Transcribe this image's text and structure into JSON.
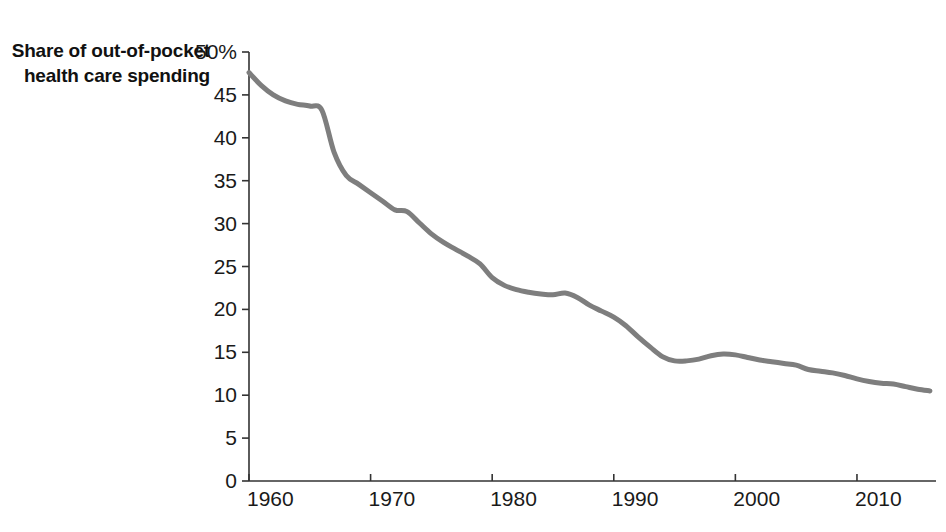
{
  "chart_data": {
    "type": "line",
    "title": "Share of out-of-pocket health care spending",
    "xlabel": "",
    "ylabel": "",
    "xlim": [
      1960,
      2016.5
    ],
    "ylim": [
      0,
      50
    ],
    "grid": false,
    "legend": null,
    "series_color": "#7e7e7e",
    "axis_color": "#333333",
    "x_tick_labels": [
      "1960",
      "1970",
      "1980",
      "1990",
      "2000",
      "2010"
    ],
    "x_ticks": [
      1960,
      1970,
      1980,
      1990,
      2000,
      2010
    ],
    "y_tick_labels": [
      "0",
      "5",
      "10",
      "15",
      "20",
      "25",
      "30",
      "35",
      "40",
      "45",
      "50%"
    ],
    "y_ticks": [
      0,
      5,
      10,
      15,
      20,
      25,
      30,
      35,
      40,
      45,
      50
    ],
    "series": [
      {
        "name": "Share of out-of-pocket health care spending",
        "x": [
          1960,
          1961,
          1962,
          1963,
          1964,
          1965,
          1966,
          1967,
          1968,
          1969,
          1970,
          1971,
          1972,
          1973,
          1974,
          1975,
          1976,
          1977,
          1978,
          1979,
          1980,
          1981,
          1982,
          1983,
          1984,
          1985,
          1986,
          1987,
          1988,
          1989,
          1990,
          1991,
          1992,
          1993,
          1994,
          1995,
          1996,
          1997,
          1998,
          1999,
          2000,
          2001,
          2002,
          2003,
          2004,
          2005,
          2006,
          2007,
          2008,
          2009,
          2010,
          2011,
          2012,
          2013,
          2014,
          2015,
          2016
        ],
        "values": [
          47.6,
          46.1,
          45.0,
          44.3,
          43.9,
          43.7,
          43.2,
          38.3,
          35.6,
          34.6,
          33.6,
          32.6,
          31.6,
          31.4,
          30.1,
          28.8,
          27.8,
          27.0,
          26.2,
          25.3,
          23.7,
          22.8,
          22.3,
          22.0,
          21.8,
          21.7,
          21.9,
          21.4,
          20.5,
          19.8,
          19.1,
          18.1,
          16.8,
          15.6,
          14.5,
          14.0,
          14.0,
          14.2,
          14.6,
          14.8,
          14.7,
          14.4,
          14.1,
          13.9,
          13.7,
          13.5,
          13.0,
          12.8,
          12.6,
          12.3,
          11.9,
          11.6,
          11.4,
          11.3,
          11.0,
          10.7,
          10.5
        ],
        "units": "percent"
      }
    ]
  }
}
